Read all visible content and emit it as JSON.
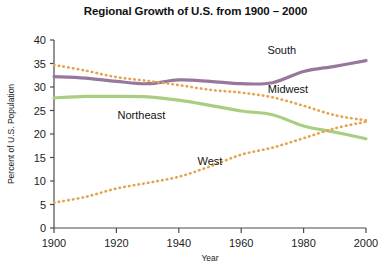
{
  "chart_data": {
    "type": "line",
    "title": "Regional Growth of U.S. from 1900 – 2000",
    "xlabel": "Year",
    "ylabel": "Percent of U.S. Population",
    "xlim": [
      1900,
      2000
    ],
    "ylim": [
      0,
      40
    ],
    "xticks": [
      1900,
      1920,
      1940,
      1960,
      1980,
      2000
    ],
    "yticks": [
      0,
      5,
      10,
      15,
      20,
      25,
      30,
      35,
      40
    ],
    "xtick_labels": [
      "1900",
      "1920",
      "1940",
      "1960",
      "1980",
      "2000"
    ],
    "ytick_labels": [
      "0",
      "5",
      "10",
      "15",
      "20",
      "25",
      "30",
      "35",
      "40"
    ],
    "grid": false,
    "legend": "inline-labels",
    "x": [
      1900,
      1910,
      1920,
      1930,
      1940,
      1950,
      1960,
      1970,
      1980,
      1990,
      2000
    ],
    "series": [
      {
        "name": "South",
        "label": "South",
        "color": "#97789c",
        "style": "solid",
        "width": 3.2,
        "label_x": 1973,
        "label_y": 37.0,
        "values": [
          32.2,
          31.9,
          31.2,
          30.7,
          31.5,
          31.2,
          30.7,
          30.9,
          33.3,
          34.4,
          35.6
        ]
      },
      {
        "name": "Midwest",
        "label": "Midwest",
        "color": "#e4a44f",
        "style": "dotted",
        "width": 2.6,
        "label_x": 1975,
        "label_y": 28.8,
        "values": [
          34.7,
          33.5,
          32.1,
          31.3,
          30.4,
          29.4,
          28.8,
          27.8,
          26.0,
          24.0,
          22.9
        ]
      },
      {
        "name": "Northeast",
        "label": "Northeast",
        "color": "#a9ce81",
        "style": "solid",
        "width": 3.2,
        "label_x": 1928,
        "label_y": 23.2,
        "values": [
          27.7,
          28.0,
          28.0,
          27.9,
          27.2,
          26.1,
          24.9,
          24.1,
          21.7,
          20.4,
          19.0
        ]
      },
      {
        "name": "West",
        "label": "West",
        "color": "#e4a44f",
        "style": "dotted",
        "width": 2.6,
        "label_x": 1950,
        "label_y": 13.4,
        "values": [
          5.4,
          6.6,
          8.4,
          9.6,
          10.9,
          13.1,
          15.6,
          17.1,
          19.1,
          21.2,
          22.6
        ]
      }
    ]
  }
}
